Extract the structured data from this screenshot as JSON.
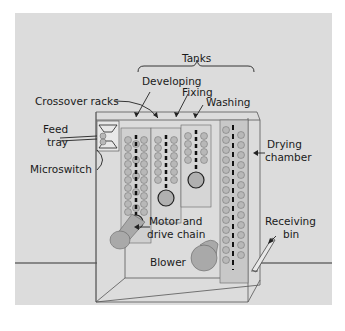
{
  "diagram": {
    "labels": {
      "tanks": "Tanks",
      "developing": "Developing",
      "fixing": "Fixing",
      "washing": "Washing",
      "crossover_racks": "Crossover racks",
      "feed_tray_line1": "Feed",
      "feed_tray_line2": "tray",
      "microswitch": "Microswitch",
      "drying_line1": "Drying",
      "drying_line2": "chamber",
      "motor_line1": "Motor and",
      "motor_line2": "drive chain",
      "receiving_line1": "Receiving",
      "receiving_line2": "bin",
      "blower": "Blower"
    },
    "colors": {
      "background": "#dcdcdc",
      "roller": "#b8b8b8",
      "roller_dark": "#2a2a2a",
      "line": "#333333",
      "motor": "#a9a9a9"
    }
  }
}
